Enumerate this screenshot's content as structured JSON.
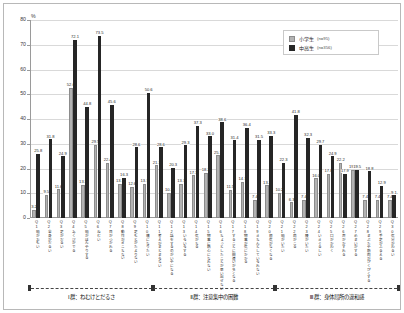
{
  "legend": {
    "series": [
      {
        "key": "shougakusei",
        "label": "小学生",
        "n": "(n=95)",
        "color": "#b3b3b3"
      },
      {
        "key": "chuukousei",
        "label": "中高生",
        "n": "(n=356)",
        "color": "#262626"
      }
    ]
  },
  "axis": {
    "unit": "%",
    "yticks": [
      "0",
      "10",
      "20",
      "30",
      "40",
      "50",
      "60",
      "70",
      "80"
    ]
  },
  "groups": [
    {
      "label": "Ⅰ群：ねむけとだるさ",
      "from": 1,
      "to": 10
    },
    {
      "label": "Ⅱ群：注意集中の困難",
      "from": 11,
      "to": 20
    },
    {
      "label": "Ⅲ群：身体局所の違和感",
      "from": 21,
      "to": 30
    }
  ],
  "chart_data": {
    "type": "bar",
    "title": "",
    "xlabel": "",
    "ylabel": "%",
    "ylim": [
      0,
      80
    ],
    "grid": true,
    "legend_position": "top-right",
    "categories": [
      "Q1",
      "Q2",
      "Q3",
      "Q4",
      "Q5",
      "Q6",
      "Q7",
      "Q8",
      "Q9",
      "Q10",
      "Q11",
      "Q12",
      "Q13",
      "Q14",
      "Q15",
      "Q16",
      "Q17",
      "Q18",
      "Q19",
      "Q20",
      "Q21",
      "Q22",
      "Q23",
      "Q24",
      "Q25",
      "Q26",
      "Q27",
      "Q28",
      "Q29",
      "Q30"
    ],
    "category_texts": [
      "頭がおもい",
      "全身がだるい",
      "足がだるい",
      "あくびがでる",
      "頭がぼんやりする",
      "ねむい",
      "目がつかれる",
      "動作がぎこちない",
      "足もとがたよりない",
      "横になりたい",
      "考えがまとまらない",
      "話をするのがいやになる",
      "いらいらする",
      "気がちる",
      "物事に熱心になれない",
      "ちょっとしたことが思い出せない",
      "することに間違いが多くなる",
      "物事が気にかかる",
      "きちんとしていられない",
      "根気がなくなる",
      "頭がいたい",
      "肩がこる",
      "腰がいたい",
      "いきぐるしい",
      "口がかわく",
      "声がかすれる",
      "めまいがする",
      "まぶたや筋肉がぴくぴくする",
      "手足がふるえる",
      "気分がわるい"
    ],
    "series": [
      {
        "name": "小学生",
        "color": "#b3b3b3",
        "values": [
          3.2,
          9.5,
          11.6,
          52.6,
          13.5,
          29.5,
          22.4,
          13.7,
          12.6,
          13.7,
          21.3,
          10.2,
          13.7,
          17.3,
          18.2,
          25.3,
          11.5,
          14.7,
          7.4,
          13.2,
          10.2,
          6.3,
          7.4,
          16.0,
          17.8,
          22.2,
          19.5,
          7.4,
          7.4,
          7.4
        ]
      },
      {
        "name": "中高生",
        "color": "#262626",
        "values": [
          25.8,
          31.8,
          24.9,
          72.1,
          44.8,
          73.5,
          45.6,
          16.3,
          28.6,
          50.6,
          28.6,
          20.3,
          29.3,
          37.3,
          33.0,
          38.6,
          31.4,
          36.4,
          31.5,
          33.3,
          22.3,
          41.8,
          32.3,
          29.7,
          24.9,
          17.9,
          19.5,
          18.8,
          12.9,
          9.1
        ]
      }
    ]
  }
}
